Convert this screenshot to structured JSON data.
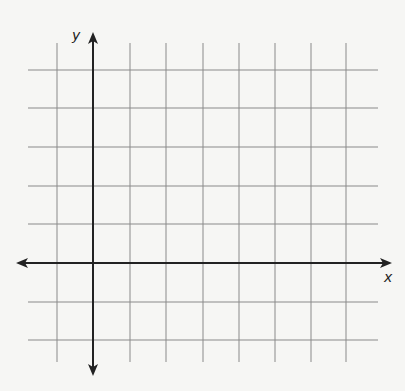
{
  "diagram": {
    "type": "coordinate-grid",
    "x_axis_label": "x",
    "y_axis_label": "y",
    "grid_color": "#8a8a8a",
    "axis_color": "#222222",
    "background": "#f6f6f4",
    "vertical_lines_x": [
      57,
      130,
      166,
      203,
      239,
      275,
      311,
      346
    ],
    "horizontal_lines_y": [
      70,
      108,
      147,
      186,
      224,
      302,
      340
    ],
    "x_axis_y": 263,
    "y_axis_x": 93,
    "grid_bounds": {
      "left": 28,
      "right": 378,
      "top": 43,
      "bottom": 362
    },
    "x_axis_extent": [
      16,
      392
    ],
    "y_axis_extent": [
      32,
      376
    ]
  }
}
